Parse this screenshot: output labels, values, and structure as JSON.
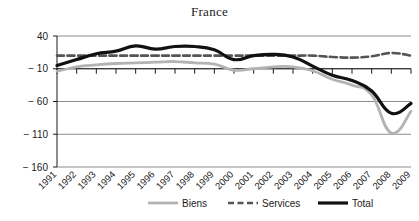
{
  "chart_data": {
    "type": "line",
    "title": "France",
    "xlabel": "",
    "ylabel": "",
    "ylim": [
      -160,
      40
    ],
    "yticks": [
      40,
      -10,
      -60,
      -110,
      -160
    ],
    "ytick_labels": [
      "40",
      "− 10",
      "− 60",
      "− 110",
      "− 160"
    ],
    "grid": true,
    "legend_position": "bottom",
    "x": [
      1991,
      1992,
      1993,
      1994,
      1995,
      1996,
      1997,
      1998,
      1999,
      2000,
      2001,
      2002,
      2003,
      2004,
      2005,
      2006,
      2007,
      2008,
      2009
    ],
    "categories": [
      "1991",
      "1992",
      "1993",
      "1994",
      "1995",
      "1996",
      "1997",
      "1998",
      "1999",
      "2000",
      "2001",
      "2002",
      "2003",
      "2004",
      "2005",
      "2006",
      "2007",
      "2008",
      "2009"
    ],
    "series": [
      {
        "name": "Biens",
        "style": "solid",
        "color": "#b3b3b3",
        "values": [
          -14,
          -7,
          -4,
          -2,
          -1,
          0,
          1,
          -1,
          -3,
          -12,
          -10,
          -7,
          -7,
          -13,
          -26,
          -35,
          -50,
          -108,
          -75
        ]
      },
      {
        "name": "Services",
        "style": "dashed",
        "color": "#555555",
        "values": [
          10,
          10,
          10,
          10,
          10,
          10,
          10,
          10,
          10,
          10,
          10,
          10,
          10,
          10,
          8,
          7,
          9,
          14,
          10
        ]
      },
      {
        "name": "Total",
        "style": "solid-bold",
        "color": "#111111",
        "values": [
          -5,
          4,
          13,
          17,
          25,
          20,
          24,
          24,
          19,
          4,
          10,
          12,
          8,
          -6,
          -20,
          -28,
          -44,
          -78,
          -63
        ]
      }
    ]
  },
  "legend": {
    "items": [
      {
        "label": "Biens",
        "marker": "solid-line-light"
      },
      {
        "label": "Services",
        "marker": "dashed-line-dark"
      },
      {
        "label": "Total",
        "marker": "solid-line-black"
      }
    ]
  }
}
